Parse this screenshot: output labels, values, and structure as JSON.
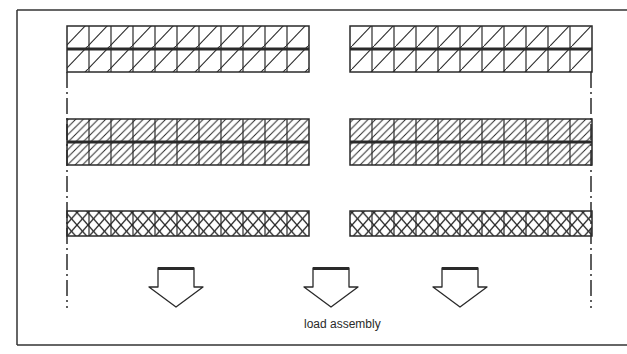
{
  "diagram": {
    "type": "schematic",
    "label": "load assembly",
    "colors": {
      "line": "#2a2a2a",
      "background": "#ffffff"
    },
    "frame": {
      "x": 17,
      "y": 10,
      "right": 640,
      "bottom": 345
    },
    "blocks": [
      {
        "name": "left-block",
        "x": 67,
        "width": 242
      },
      {
        "name": "right-block",
        "x": 350,
        "width": 242
      }
    ],
    "cells_per_block": 11,
    "rows": [
      {
        "name": "row-sparse-hatch",
        "pattern": "sparse-diagonal",
        "y": 26,
        "height": 46,
        "split": true
      },
      {
        "name": "row-dense-hatch",
        "pattern": "dense-diagonal",
        "y": 119,
        "height": 46,
        "split": true
      },
      {
        "name": "row-cross-hatch",
        "pattern": "cross-hatch",
        "y": 211,
        "height": 25,
        "split": false
      }
    ],
    "boundary_lines": [
      {
        "name": "left-boundary",
        "x": 67,
        "y1": 72,
        "y2": 308
      },
      {
        "name": "right-boundary",
        "x": 591,
        "y1": 72,
        "y2": 308
      }
    ],
    "arrows": [
      {
        "name": "arrow-1",
        "cx": 176
      },
      {
        "name": "arrow-2",
        "cx": 331
      },
      {
        "name": "arrow-3",
        "cx": 460
      }
    ]
  }
}
